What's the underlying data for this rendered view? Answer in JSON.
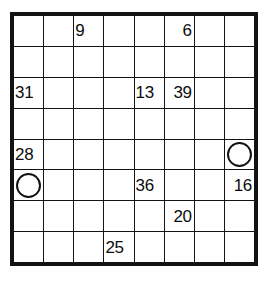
{
  "puzzle": {
    "type": "number-fill-grid",
    "rows": 8,
    "columns": 8,
    "colors": {
      "blocked_cell": "#8b8b8b",
      "open_cell": "#ffffff",
      "grid_line": "#131313",
      "text": "#0c0c0c"
    },
    "cells": [
      [
        {
          "state": "blocked",
          "value": ""
        },
        {
          "state": "blocked",
          "value": ""
        },
        {
          "state": "open",
          "value": "9"
        },
        {
          "state": "open",
          "value": ""
        },
        {
          "state": "open",
          "value": ""
        },
        {
          "state": "open",
          "value": "6"
        },
        {
          "state": "blocked",
          "value": ""
        },
        {
          "state": "blocked",
          "value": ""
        }
      ],
      [
        {
          "state": "blocked",
          "value": ""
        },
        {
          "state": "blocked",
          "value": ""
        },
        {
          "state": "open",
          "value": ""
        },
        {
          "state": "open",
          "value": ""
        },
        {
          "state": "open",
          "value": ""
        },
        {
          "state": "open",
          "value": ""
        },
        {
          "state": "blocked",
          "value": ""
        },
        {
          "state": "blocked",
          "value": ""
        }
      ],
      [
        {
          "state": "open",
          "value": "31"
        },
        {
          "state": "open",
          "value": ""
        },
        {
          "state": "open",
          "value": ""
        },
        {
          "state": "open",
          "value": ""
        },
        {
          "state": "open",
          "value": "13"
        },
        {
          "state": "open",
          "value": "39"
        },
        {
          "state": "open",
          "value": ""
        },
        {
          "state": "open",
          "value": ""
        }
      ],
      [
        {
          "state": "open",
          "value": ""
        },
        {
          "state": "open",
          "value": ""
        },
        {
          "state": "open",
          "value": ""
        },
        {
          "state": "blocked",
          "value": ""
        },
        {
          "state": "blocked",
          "value": ""
        },
        {
          "state": "open",
          "value": ""
        },
        {
          "state": "open",
          "value": ""
        },
        {
          "state": "open",
          "value": ""
        }
      ],
      [
        {
          "state": "open",
          "value": "28"
        },
        {
          "state": "open",
          "value": ""
        },
        {
          "state": "open",
          "value": ""
        },
        {
          "state": "blocked",
          "value": ""
        },
        {
          "state": "blocked",
          "value": ""
        },
        {
          "state": "open",
          "value": ""
        },
        {
          "state": "open",
          "value": ""
        },
        {
          "state": "open",
          "value": "",
          "marker": "circle"
        }
      ],
      [
        {
          "state": "open",
          "value": "",
          "marker": "circle"
        },
        {
          "state": "open",
          "value": ""
        },
        {
          "state": "open",
          "value": ""
        },
        {
          "state": "open",
          "value": ""
        },
        {
          "state": "open",
          "value": "36"
        },
        {
          "state": "open",
          "value": ""
        },
        {
          "state": "open",
          "value": ""
        },
        {
          "state": "open",
          "value": "16"
        }
      ],
      [
        {
          "state": "blocked",
          "value": ""
        },
        {
          "state": "blocked",
          "value": ""
        },
        {
          "state": "open",
          "value": ""
        },
        {
          "state": "open",
          "value": ""
        },
        {
          "state": "open",
          "value": ""
        },
        {
          "state": "open",
          "value": "20"
        },
        {
          "state": "blocked",
          "value": ""
        },
        {
          "state": "blocked",
          "value": ""
        }
      ],
      [
        {
          "state": "blocked",
          "value": ""
        },
        {
          "state": "blocked",
          "value": ""
        },
        {
          "state": "open",
          "value": ""
        },
        {
          "state": "open",
          "value": "25"
        },
        {
          "state": "open",
          "value": ""
        },
        {
          "state": "open",
          "value": ""
        },
        {
          "state": "blocked",
          "value": ""
        },
        {
          "state": "blocked",
          "value": ""
        }
      ]
    ]
  }
}
